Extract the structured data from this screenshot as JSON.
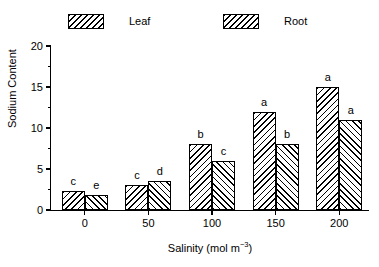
{
  "chart_data": {
    "type": "bar",
    "title": "",
    "xlabel": "Salinity (mol m−3)",
    "ylabel": "Sodium Content",
    "categories": [
      "0",
      "50",
      "100",
      "150",
      "200"
    ],
    "series": [
      {
        "name": "Leaf",
        "values": [
          2.3,
          3.0,
          8.0,
          12.0,
          15.0
        ],
        "letters": [
          "c",
          "c",
          "b",
          "a",
          "a"
        ],
        "hatch": "backward-diagonal"
      },
      {
        "name": "Root",
        "values": [
          1.8,
          3.5,
          6.0,
          8.0,
          11.0
        ],
        "letters": [
          "e",
          "d",
          "c",
          "b",
          "a"
        ],
        "hatch": "forward-diagonal"
      }
    ],
    "ylim": [
      0,
      20
    ],
    "yticks": [
      0,
      5,
      10,
      15,
      20
    ],
    "ytick_labels": [
      "0",
      "5",
      "10",
      "15",
      "20"
    ],
    "yminor_ticks": [
      2.5,
      7.5,
      12.5,
      17.5
    ],
    "grid": false,
    "legend_position": "top",
    "colors": {
      "line": "#000000",
      "fill": "#ffffff",
      "hatch": "#000000",
      "background": "#ffffff"
    }
  },
  "legend": {
    "entries": [
      {
        "label": "Leaf"
      },
      {
        "label": "Root"
      }
    ]
  },
  "xlabel_parts": {
    "main": "Salinity (mol m",
    "superscript": "−3",
    "close": ")"
  }
}
